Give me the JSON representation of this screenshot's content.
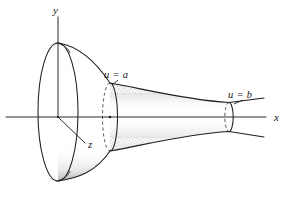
{
  "figure": {
    "kind": "line-engraving",
    "background_color": "#ffffff",
    "ink_color": "#1f1f1f",
    "width": 287,
    "height": 200
  },
  "axes": {
    "x": {
      "label": "x",
      "label_x": 274,
      "label_y": 121,
      "line": {
        "x1": 6,
        "y1": 117,
        "x2": 266,
        "y2": 117
      }
    },
    "y": {
      "label": "y",
      "label_x": 53,
      "label_y": 14,
      "line": {
        "x1": 58,
        "y1": 17,
        "x2": 58,
        "y2": 117
      }
    },
    "z": {
      "label": "z",
      "label_x": 88,
      "label_y": 148,
      "line": {
        "x1": 58,
        "y1": 117,
        "x2": 85,
        "y2": 143
      }
    }
  },
  "cross_sections": [
    {
      "name": "u-equals-a",
      "label": "u = a",
      "label_x": 104,
      "label_y": 78,
      "center_x": 110,
      "center_y": 117,
      "rx": 7.5,
      "ry": 34,
      "leader": {
        "x1": 118,
        "y1": 80,
        "x2": 112,
        "y2": 85
      }
    },
    {
      "name": "u-equals-b",
      "label": "u = b",
      "label_x": 228,
      "label_y": 98,
      "center_x": 229,
      "center_y": 117,
      "rx": 4.2,
      "ry": 14.5,
      "leader": {
        "x1": 243,
        "y1": 100,
        "x2": 234,
        "y2": 104
      }
    }
  ],
  "bell": {
    "name": "flared-mouth-ellipse",
    "center_x": 58,
    "center_y": 112,
    "rx": 20,
    "ry": 69
  },
  "surface": {
    "name": "stippled-tube-surface",
    "shading": "stipple",
    "stipple_color": "#3c3c3c"
  },
  "origin": {
    "name": "origin-point",
    "x": 58,
    "y": 117
  }
}
